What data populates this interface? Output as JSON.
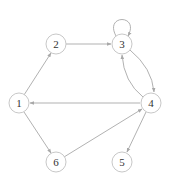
{
  "diagram": {
    "type": "directed-graph",
    "colors": {
      "node_stroke": "#c8c8c8",
      "edge": "#a8a8a8",
      "label": "#333333",
      "background": "#ffffff"
    },
    "nodes": [
      {
        "id": "1",
        "label": "1",
        "x": 19,
        "y": 103
      },
      {
        "id": "2",
        "label": "2",
        "x": 56,
        "y": 44
      },
      {
        "id": "3",
        "label": "3",
        "x": 122,
        "y": 44
      },
      {
        "id": "4",
        "label": "4",
        "x": 151,
        "y": 103
      },
      {
        "id": "5",
        "label": "5",
        "x": 122,
        "y": 162
      },
      {
        "id": "6",
        "label": "6",
        "x": 56,
        "y": 162
      }
    ],
    "edges": [
      {
        "from": "1",
        "to": "2"
      },
      {
        "from": "2",
        "to": "3"
      },
      {
        "from": "3",
        "to": "3"
      },
      {
        "from": "3",
        "to": "4"
      },
      {
        "from": "4",
        "to": "3"
      },
      {
        "from": "4",
        "to": "1"
      },
      {
        "from": "1",
        "to": "6"
      },
      {
        "from": "6",
        "to": "4"
      },
      {
        "from": "4",
        "to": "5"
      }
    ]
  }
}
